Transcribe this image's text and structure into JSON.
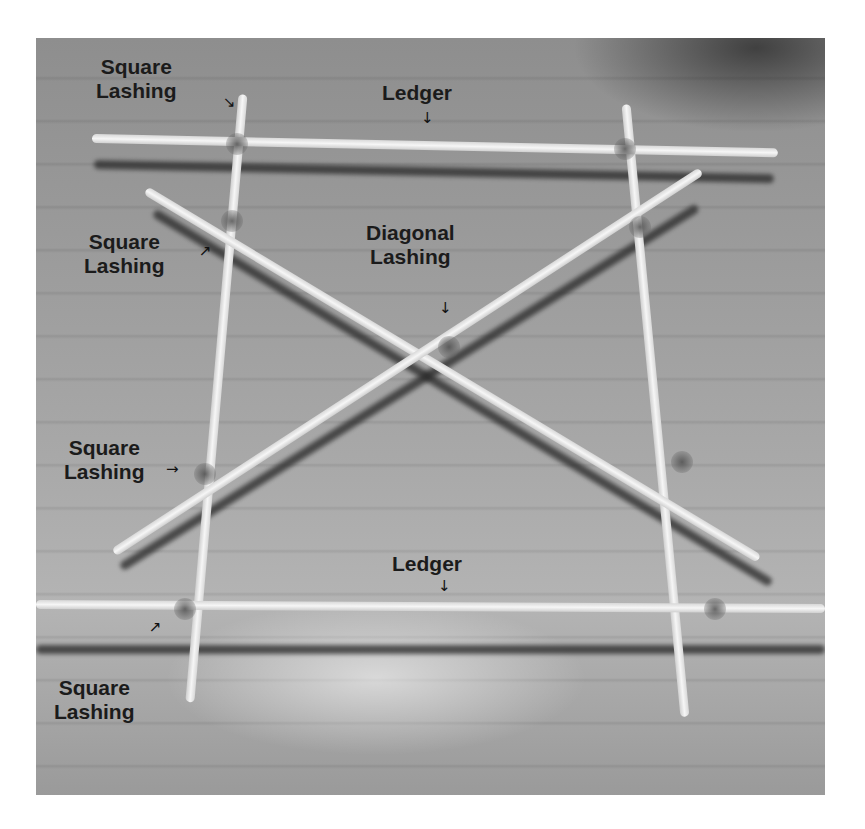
{
  "figure": {
    "labels": [
      {
        "id": "square-lashing-top-left",
        "line1": "Square",
        "line2": "Lashing",
        "arrow": "↘"
      },
      {
        "id": "ledger-top",
        "line1": "Ledger",
        "arrow": "↓"
      },
      {
        "id": "square-lashing-upper-left",
        "line1": "Square",
        "line2": "Lashing",
        "arrow": "↗"
      },
      {
        "id": "diagonal-lashing-center",
        "line1": "Diagonal",
        "line2": "Lashing",
        "arrow": "↓"
      },
      {
        "id": "square-lashing-middle-left",
        "line1": "Square",
        "line2": "Lashing",
        "arrow": "→"
      },
      {
        "id": "ledger-bottom",
        "line1": "Ledger",
        "arrow": "↓"
      },
      {
        "id": "square-lashing-bottom-left",
        "line1": "Square",
        "line2": "Lashing",
        "arrow": "↗"
      }
    ]
  }
}
